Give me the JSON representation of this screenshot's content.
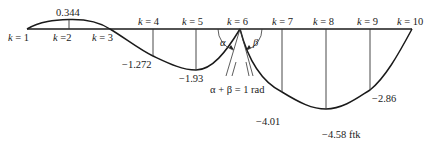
{
  "figure": {
    "type": "influence-line diagram",
    "axis_labels": [
      {
        "k": "1",
        "text": "k = 1"
      },
      {
        "k": "2",
        "text": "k =2"
      },
      {
        "k": "3",
        "text": "k = 3"
      },
      {
        "k": "4",
        "text": "k = 4"
      },
      {
        "k": "5",
        "text": "k = 5"
      },
      {
        "k": "6",
        "text": "k = 6"
      },
      {
        "k": "7",
        "text": "k = 7"
      },
      {
        "k": "8",
        "text": "k = 8"
      },
      {
        "k": "9",
        "text": "k = 9"
      },
      {
        "k": "10",
        "text": "k = 10"
      }
    ],
    "ordinates": [
      {
        "k": 2,
        "value": "0.344"
      },
      {
        "k": 4,
        "value": "−1.272"
      },
      {
        "k": 5,
        "value": "−1.93"
      },
      {
        "k": 7,
        "value": "−4.01"
      },
      {
        "k": 8,
        "value": "−4.58 ftk"
      },
      {
        "k": 9,
        "value": "−2.86"
      }
    ],
    "angles": {
      "alpha": "α",
      "beta": "β",
      "relation": "α + β = 1 rad"
    }
  }
}
